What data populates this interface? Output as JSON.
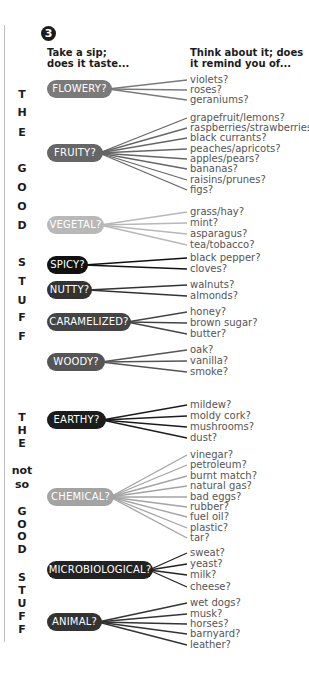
{
  "step_number": "3",
  "headings": {
    "left": [
      "Take a sip;",
      "does it taste..."
    ],
    "right": [
      "Think about it; does",
      "it remind you of..."
    ]
  },
  "side_labels": {
    "good": [
      {
        "text": "T",
        "y": 95
      },
      {
        "text": "H",
        "y": 113
      },
      {
        "text": "E",
        "y": 133
      },
      {
        "text": "G",
        "y": 169
      },
      {
        "text": "O",
        "y": 188
      },
      {
        "text": "O",
        "y": 207
      },
      {
        "text": "D",
        "y": 226
      },
      {
        "text": "S",
        "y": 263
      },
      {
        "text": "T",
        "y": 282
      },
      {
        "text": "U",
        "y": 301
      },
      {
        "text": "F",
        "y": 318
      },
      {
        "text": "F",
        "y": 337
      }
    ],
    "not_so_good": [
      {
        "text": "T",
        "y": 418
      },
      {
        "text": "H",
        "y": 431
      },
      {
        "text": "E",
        "y": 444
      },
      {
        "text": "not",
        "y": 471
      },
      {
        "text": "so",
        "y": 485
      },
      {
        "text": "G",
        "y": 512
      },
      {
        "text": "O",
        "y": 525
      },
      {
        "text": "O",
        "y": 537
      },
      {
        "text": "D",
        "y": 550
      },
      {
        "text": "S",
        "y": 578
      },
      {
        "text": "T",
        "y": 591
      },
      {
        "text": "U",
        "y": 604
      },
      {
        "text": "F",
        "y": 617
      },
      {
        "text": "F",
        "y": 630
      }
    ]
  },
  "categories": [
    {
      "label": "FLOWERY?",
      "color": "#7a7a7a",
      "y": 89,
      "width": 65,
      "items": [
        {
          "t": "violets?",
          "y": 80
        },
        {
          "t": "roses?",
          "y": 90
        },
        {
          "t": "geraniums?",
          "y": 100
        }
      ]
    },
    {
      "label": "FRUITY?",
      "color": "#666666",
      "y": 153,
      "width": 56,
      "items": [
        {
          "t": "grapefruit/lemons?",
          "y": 118
        },
        {
          "t": "raspberries/strawberries?",
          "y": 128
        },
        {
          "t": "black currants?",
          "y": 138
        },
        {
          "t": "peaches/apricots?",
          "y": 149
        },
        {
          "t": "apples/pears?",
          "y": 159
        },
        {
          "t": "bananas?",
          "y": 169
        },
        {
          "t": "raisins/prunes?",
          "y": 180
        },
        {
          "t": "figs?",
          "y": 190
        }
      ]
    },
    {
      "label": "VEGETAL?",
      "color": "#b8b8b8",
      "y": 225,
      "width": 57,
      "items": [
        {
          "t": "grass/hay?",
          "y": 212
        },
        {
          "t": "mint?",
          "y": 223
        },
        {
          "t": "asparagus?",
          "y": 234
        },
        {
          "t": "tea/tobacco?",
          "y": 245
        }
      ]
    },
    {
      "label": "SPICY?",
      "color": "#111111",
      "y": 265,
      "width": 41,
      "items": [
        {
          "t": "black pepper?",
          "y": 258
        },
        {
          "t": "cloves?",
          "y": 269
        }
      ]
    },
    {
      "label": "NUTTY?",
      "color": "#333333",
      "y": 290,
      "width": 45,
      "items": [
        {
          "t": "walnuts?",
          "y": 285
        },
        {
          "t": "almonds?",
          "y": 296
        }
      ]
    },
    {
      "label": "CARAMELIZED?",
      "color": "#444444",
      "y": 322,
      "width": 84,
      "items": [
        {
          "t": "honey?",
          "y": 312
        },
        {
          "t": "brown sugar?",
          "y": 323
        },
        {
          "t": "butter?",
          "y": 334
        }
      ]
    },
    {
      "label": "WOODY?",
      "color": "#555555",
      "y": 362,
      "width": 58,
      "items": [
        {
          "t": "oak?",
          "y": 350
        },
        {
          "t": "vanilla?",
          "y": 361
        },
        {
          "t": "smoke?",
          "y": 372
        }
      ]
    },
    {
      "label": "EARTHY?",
      "color": "#1c1c1c",
      "y": 420,
      "width": 59,
      "items": [
        {
          "t": "mildew?",
          "y": 405
        },
        {
          "t": "moldy cork?",
          "y": 416
        },
        {
          "t": "mushrooms?",
          "y": 427
        },
        {
          "t": "dust?",
          "y": 438
        }
      ]
    },
    {
      "label": "CHEMICAL?",
      "color": "#a3a3a3",
      "y": 497,
      "width": 67,
      "items": [
        {
          "t": "vinegar?",
          "y": 455
        },
        {
          "t": "petroleum?",
          "y": 465
        },
        {
          "t": "burnt match?",
          "y": 476
        },
        {
          "t": "natural gas?",
          "y": 486
        },
        {
          "t": "bad eggs?",
          "y": 497
        },
        {
          "t": "rubber?",
          "y": 507
        },
        {
          "t": "fuel oil?",
          "y": 517
        },
        {
          "t": "plastic?",
          "y": 528
        },
        {
          "t": "tar?",
          "y": 538
        }
      ]
    },
    {
      "label": "MICROBIOLOGICAL?",
      "color": "#222222",
      "y": 570,
      "width": 106,
      "items": [
        {
          "t": "sweat?",
          "y": 553
        },
        {
          "t": "yeast?",
          "y": 564
        },
        {
          "t": "milk?",
          "y": 575
        },
        {
          "t": "cheese?",
          "y": 587
        }
      ]
    },
    {
      "label": "ANIMAL?",
      "color": "#333333",
      "y": 622,
      "width": 55,
      "items": [
        {
          "t": "wet dogs?",
          "y": 603
        },
        {
          "t": "musk?",
          "y": 614
        },
        {
          "t": "horses?",
          "y": 624
        },
        {
          "t": "barnyard?",
          "y": 634
        },
        {
          "t": "leather?",
          "y": 645
        }
      ]
    }
  ]
}
